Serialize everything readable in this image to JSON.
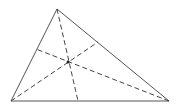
{
  "diagram": {
    "type": "triangle-cevians",
    "colors": {
      "stroke": "#555555",
      "background": "#ffffff"
    },
    "vertices": {
      "A": [
        57,
        9
      ],
      "B": [
        11,
        101
      ],
      "C": [
        169,
        101
      ]
    },
    "feet": {
      "on_BC": [
        78,
        101
      ],
      "on_AB": [
        36,
        49
      ],
      "on_AC": [
        98,
        42
      ]
    },
    "concurrency_point": [
      68,
      62
    ]
  }
}
